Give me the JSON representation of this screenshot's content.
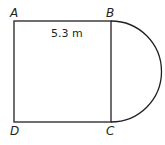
{
  "diagram": {
    "type": "geometry-figure",
    "vertices": {
      "A": "A",
      "B": "B",
      "C": "C",
      "D": "D"
    },
    "side_length_label": "5.3 m",
    "shapes": [
      "square",
      "semicircle"
    ],
    "stroke_color": "#231f20"
  }
}
